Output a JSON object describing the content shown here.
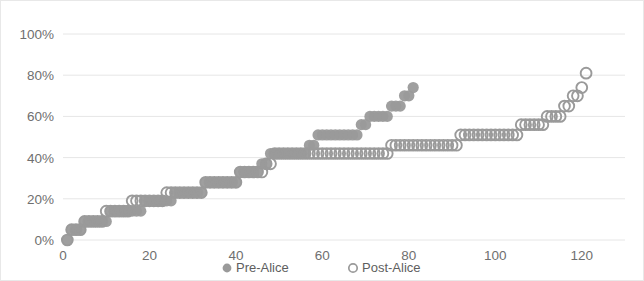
{
  "chart_data": {
    "type": "scatter",
    "title": "",
    "subtitle": "",
    "xlabel": "",
    "ylabel": "",
    "xlim": [
      0,
      130
    ],
    "ylim": [
      0,
      1.0
    ],
    "grid": true,
    "grid_axis": "y",
    "legend_position": "bottom",
    "x_ticks": [
      0,
      20,
      40,
      60,
      80,
      100,
      120
    ],
    "x_tick_labels": [
      "0",
      "20",
      "40",
      "60",
      "80",
      "100",
      "120"
    ],
    "y_ticks": [
      0,
      0.2,
      0.4,
      0.6,
      0.8,
      1.0
    ],
    "y_tick_labels": [
      "0%",
      "20%",
      "40%",
      "60%",
      "80%",
      "100%"
    ],
    "series": [
      {
        "name": "Pre-Alice",
        "marker": "filled-circle",
        "color": "#9a9a9a",
        "x": [
          1,
          2,
          3,
          4,
          5,
          6,
          7,
          8,
          9,
          10,
          11,
          12,
          13,
          14,
          15,
          16,
          17,
          18,
          19,
          20,
          21,
          22,
          23,
          24,
          25,
          26,
          27,
          28,
          29,
          30,
          31,
          32,
          33,
          34,
          35,
          36,
          37,
          38,
          39,
          40,
          41,
          42,
          43,
          44,
          45,
          46,
          47,
          48,
          49,
          50,
          51,
          52,
          53,
          54,
          55,
          56,
          57,
          58,
          59,
          60,
          61,
          62,
          63,
          64,
          65,
          66,
          67,
          68,
          69,
          70,
          71,
          72,
          73,
          74,
          75,
          76,
          77,
          78,
          79,
          80,
          81
        ],
        "y": [
          0.0,
          0.05,
          0.05,
          0.05,
          0.09,
          0.09,
          0.09,
          0.09,
          0.09,
          0.09,
          0.14,
          0.14,
          0.14,
          0.14,
          0.14,
          0.14,
          0.14,
          0.14,
          0.19,
          0.19,
          0.19,
          0.19,
          0.19,
          0.19,
          0.19,
          0.23,
          0.23,
          0.23,
          0.23,
          0.23,
          0.23,
          0.23,
          0.28,
          0.28,
          0.28,
          0.28,
          0.28,
          0.28,
          0.28,
          0.28,
          0.33,
          0.33,
          0.33,
          0.33,
          0.33,
          0.37,
          0.37,
          0.42,
          0.42,
          0.42,
          0.42,
          0.42,
          0.42,
          0.42,
          0.42,
          0.42,
          0.46,
          0.46,
          0.51,
          0.51,
          0.51,
          0.51,
          0.51,
          0.51,
          0.51,
          0.51,
          0.51,
          0.51,
          0.56,
          0.56,
          0.6,
          0.6,
          0.6,
          0.6,
          0.6,
          0.65,
          0.65,
          0.65,
          0.7,
          0.7,
          0.74
        ]
      },
      {
        "name": "Post-Alice",
        "marker": "open-circle",
        "color": "#9a9a9a",
        "x": [
          1,
          2,
          3,
          4,
          5,
          6,
          7,
          8,
          9,
          10,
          11,
          12,
          13,
          14,
          15,
          16,
          17,
          18,
          19,
          20,
          21,
          22,
          23,
          24,
          25,
          26,
          27,
          28,
          29,
          30,
          31,
          32,
          33,
          34,
          35,
          36,
          37,
          38,
          39,
          40,
          41,
          42,
          43,
          44,
          45,
          46,
          47,
          48,
          49,
          50,
          51,
          52,
          53,
          54,
          55,
          56,
          57,
          58,
          59,
          60,
          61,
          62,
          63,
          64,
          65,
          66,
          67,
          68,
          69,
          70,
          71,
          72,
          73,
          74,
          75,
          76,
          77,
          78,
          79,
          80,
          81,
          82,
          83,
          84,
          85,
          86,
          87,
          88,
          89,
          90,
          91,
          92,
          93,
          94,
          95,
          96,
          97,
          98,
          99,
          100,
          101,
          102,
          103,
          104,
          105,
          106,
          107,
          108,
          109,
          110,
          111,
          112,
          113,
          114,
          115,
          116,
          117,
          118,
          119,
          120,
          121
        ],
        "y": [
          0.0,
          0.05,
          0.05,
          0.05,
          0.09,
          0.09,
          0.09,
          0.09,
          0.09,
          0.14,
          0.14,
          0.14,
          0.14,
          0.14,
          0.14,
          0.19,
          0.19,
          0.19,
          0.19,
          0.19,
          0.19,
          0.19,
          0.19,
          0.23,
          0.23,
          0.23,
          0.23,
          0.23,
          0.23,
          0.23,
          0.23,
          0.23,
          0.28,
          0.28,
          0.28,
          0.28,
          0.28,
          0.28,
          0.28,
          0.28,
          0.33,
          0.33,
          0.33,
          0.33,
          0.33,
          0.33,
          0.37,
          0.37,
          0.42,
          0.42,
          0.42,
          0.42,
          0.42,
          0.42,
          0.42,
          0.42,
          0.42,
          0.42,
          0.42,
          0.42,
          0.42,
          0.42,
          0.42,
          0.42,
          0.42,
          0.42,
          0.42,
          0.42,
          0.42,
          0.42,
          0.42,
          0.42,
          0.42,
          0.42,
          0.42,
          0.46,
          0.46,
          0.46,
          0.46,
          0.46,
          0.46,
          0.46,
          0.46,
          0.46,
          0.46,
          0.46,
          0.46,
          0.46,
          0.46,
          0.46,
          0.46,
          0.51,
          0.51,
          0.51,
          0.51,
          0.51,
          0.51,
          0.51,
          0.51,
          0.51,
          0.51,
          0.51,
          0.51,
          0.51,
          0.51,
          0.56,
          0.56,
          0.56,
          0.56,
          0.56,
          0.56,
          0.6,
          0.6,
          0.6,
          0.6,
          0.65,
          0.65,
          0.7,
          0.7,
          0.74,
          0.81
        ]
      }
    ],
    "legend": [
      {
        "label": "Pre-Alice",
        "marker": "filled-circle",
        "color": "#9a9a9a"
      },
      {
        "label": "Post-Alice",
        "marker": "open-circle",
        "color": "#9a9a9a"
      }
    ]
  },
  "style": {
    "plot_background": "#ffffff",
    "grid_color": "#e6e6e6",
    "tick_label_color": "#6f6f6f",
    "border_color": "#e8e8e8"
  }
}
